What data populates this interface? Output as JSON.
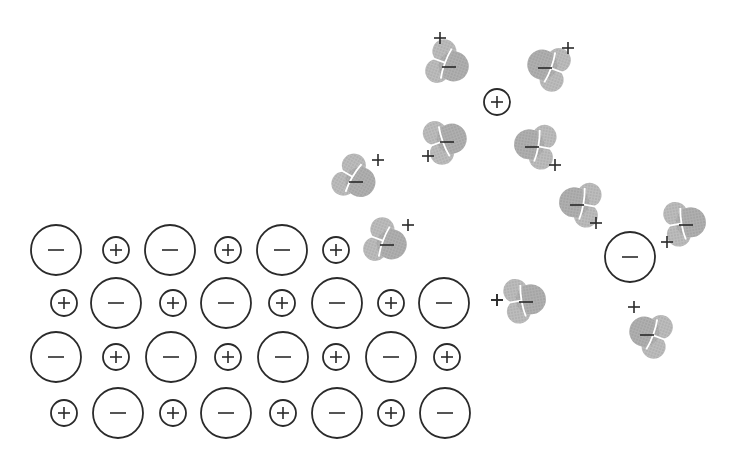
{
  "diagram": {
    "colors": {
      "background": "#ffffff",
      "ion_stroke": "#2a2a2a",
      "water_oxygen": "#a9a9a9",
      "water_hydrogen": "#b8b8b8",
      "water_divider": "#ffffff",
      "sign": "#2a2a2a"
    },
    "symbols": {
      "anion": "−",
      "cation": "+"
    },
    "radii": {
      "anion": 25,
      "cation": 13
    },
    "lattice": {
      "rows": [
        {
          "y": 250,
          "ions": [
            {
              "type": "anion",
              "x": 56
            },
            {
              "type": "cation",
              "x": 116
            },
            {
              "type": "anion",
              "x": 170
            },
            {
              "type": "cation",
              "x": 228
            },
            {
              "type": "anion",
              "x": 282
            },
            {
              "type": "cation",
              "x": 336
            }
          ]
        },
        {
          "y": 303,
          "ions": [
            {
              "type": "cation",
              "x": 64
            },
            {
              "type": "anion",
              "x": 116
            },
            {
              "type": "cation",
              "x": 173
            },
            {
              "type": "anion",
              "x": 226
            },
            {
              "type": "cation",
              "x": 282
            },
            {
              "type": "anion",
              "x": 337
            },
            {
              "type": "cation",
              "x": 391
            },
            {
              "type": "anion",
              "x": 444
            }
          ]
        },
        {
          "y": 357,
          "ions": [
            {
              "type": "anion",
              "x": 56
            },
            {
              "type": "cation",
              "x": 116
            },
            {
              "type": "anion",
              "x": 171
            },
            {
              "type": "cation",
              "x": 228
            },
            {
              "type": "anion",
              "x": 283
            },
            {
              "type": "cation",
              "x": 336
            },
            {
              "type": "anion",
              "x": 391
            },
            {
              "type": "cation",
              "x": 447
            }
          ]
        },
        {
          "y": 413,
          "ions": [
            {
              "type": "cation",
              "x": 64
            },
            {
              "type": "anion",
              "x": 118
            },
            {
              "type": "cation",
              "x": 173
            },
            {
              "type": "anion",
              "x": 226
            },
            {
              "type": "cation",
              "x": 283
            },
            {
              "type": "anion",
              "x": 337
            },
            {
              "type": "cation",
              "x": 391
            },
            {
              "type": "anion",
              "x": 445
            }
          ]
        }
      ]
    },
    "free_ions": [
      {
        "label": "dissolved-cation",
        "type": "cation",
        "x": 497,
        "y": 102
      },
      {
        "label": "dissolved-anion",
        "type": "anion",
        "x": 630,
        "y": 257
      }
    ],
    "loose_charges": [
      {
        "label": "lattice-edge-cation-charge",
        "symbol": "+",
        "x": 497,
        "y": 300
      }
    ],
    "water_molecules": [
      {
        "id": "w1",
        "cx": 450,
        "cy": 65,
        "rot": 200,
        "plus": {
          "x": 440,
          "y": 38
        }
      },
      {
        "id": "w2",
        "cx": 546,
        "cy": 66,
        "rot": 20,
        "plus": {
          "x": 568,
          "y": 48
        }
      },
      {
        "id": "w3",
        "cx": 448,
        "cy": 140,
        "rot": 160,
        "plus": {
          "x": 428,
          "y": 156
        }
      },
      {
        "id": "w4",
        "cx": 533,
        "cy": 145,
        "rot": 10,
        "plus": {
          "x": 555,
          "y": 165
        }
      },
      {
        "id": "w5",
        "cx": 357,
        "cy": 180,
        "rot": 210,
        "plus": {
          "x": 378,
          "y": 160
        }
      },
      {
        "id": "w6",
        "cx": 578,
        "cy": 203,
        "rot": 10,
        "plus": {
          "x": 596,
          "y": 223
        }
      },
      {
        "id": "w7",
        "cx": 687,
        "cy": 223,
        "rot": 170,
        "plus": {
          "x": 667,
          "y": 242
        }
      },
      {
        "id": "w8",
        "cx": 388,
        "cy": 243,
        "rot": 200,
        "plus": {
          "x": 408,
          "y": 225
        }
      },
      {
        "id": "w9",
        "cx": 527,
        "cy": 300,
        "rot": 170,
        "plus": {
          "x": 497,
          "y": 300
        }
      },
      {
        "id": "w10",
        "cx": 648,
        "cy": 333,
        "rot": 20,
        "plus": {
          "x": 634,
          "y": 307
        }
      }
    ]
  }
}
